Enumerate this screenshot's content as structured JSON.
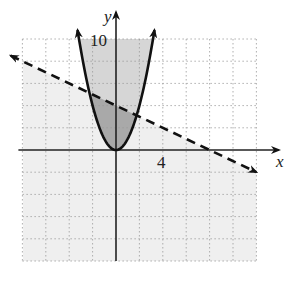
{
  "chart_data": {
    "type": "line",
    "title": "",
    "xlabel": "x",
    "ylabel": "y",
    "tick_labels": {
      "x": [
        "4"
      ],
      "y": [
        "10"
      ]
    },
    "xlim": [
      -8,
      12
    ],
    "ylim": [
      -10,
      10
    ],
    "grid": true,
    "grid_step": 2,
    "series": [
      {
        "name": "parabola",
        "equation": "y = x^2",
        "style": "solid",
        "boundary": "y >= x^2",
        "arrows": "both ends"
      },
      {
        "name": "line",
        "equation": "y = -x/2 + 4",
        "style": "dashed",
        "boundary": "y < -x/2 + 4",
        "arrows": "both ends",
        "points": [
          [
            -9,
            8.5
          ],
          [
            0,
            4
          ],
          [
            8,
            0
          ],
          [
            12,
            -2
          ]
        ]
      }
    ],
    "intersections": [
      [
        -2.27,
        5.14
      ],
      [
        1.77,
        3.12
      ]
    ],
    "shading": {
      "inside_parabola": "#d6d6d6",
      "below_line": "#efefef",
      "overlap": "#a9a9a9"
    },
    "axis_labels": {
      "x": "x",
      "y": "y"
    }
  }
}
